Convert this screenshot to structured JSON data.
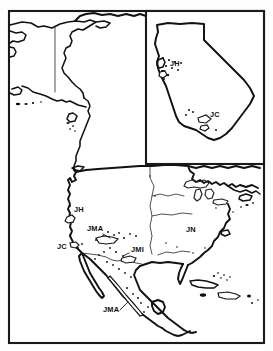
{
  "figure": {
    "type": "distribution-map",
    "region": "North America",
    "background_color": "#ffffff",
    "line_color": "#111111",
    "frame": {
      "x": 9,
      "y": 11,
      "width": 255,
      "height": 332
    },
    "inset": {
      "name": "California inset",
      "x": 146,
      "y": 11,
      "width": 118,
      "height": 153
    }
  },
  "labels": {
    "main_map": [
      {
        "code": "JH",
        "x": 74,
        "y": 212
      },
      {
        "code": "JMA",
        "x": 87,
        "y": 231
      },
      {
        "code": "JC",
        "x": 57,
        "y": 249
      },
      {
        "code": "JMI",
        "x": 131,
        "y": 252
      },
      {
        "code": "JN",
        "x": 186,
        "y": 232
      },
      {
        "code": "JMA",
        "x": 103,
        "y": 312
      }
    ],
    "inset_map": [
      {
        "code": "JH",
        "x": 170,
        "y": 66
      },
      {
        "code": "JC",
        "x": 210,
        "y": 117
      }
    ]
  },
  "legend_codes": [
    "JH",
    "JC",
    "JMA",
    "JMI",
    "JN"
  ],
  "occurrence_points": {
    "inset_count": 14,
    "main_count": 41
  }
}
